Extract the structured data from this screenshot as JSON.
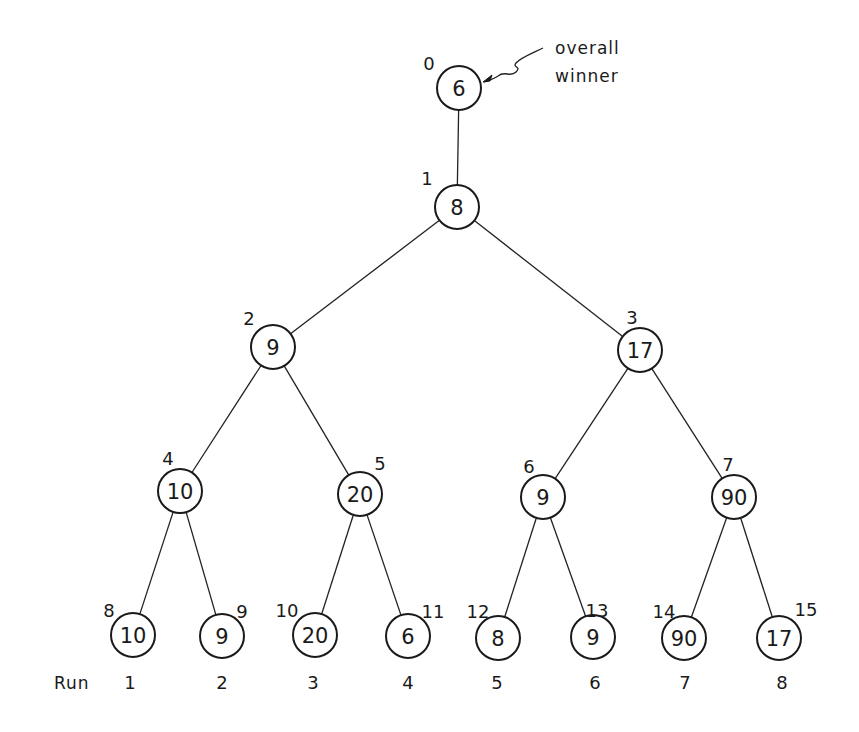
{
  "diagram": {
    "annotation": {
      "line1": "overall",
      "line2": "winner",
      "points_to_node": 0
    },
    "run_label": "Run",
    "nodes": [
      {
        "index": "0",
        "value": "6",
        "x": 459,
        "y": 88
      },
      {
        "index": "1",
        "value": "8",
        "x": 457,
        "y": 207
      },
      {
        "index": "2",
        "value": "9",
        "x": 273,
        "y": 347
      },
      {
        "index": "3",
        "value": "17",
        "x": 640,
        "y": 350
      },
      {
        "index": "4",
        "value": "10",
        "x": 180,
        "y": 491
      },
      {
        "index": "5",
        "value": "20",
        "x": 360,
        "y": 494
      },
      {
        "index": "6",
        "value": "9",
        "x": 543,
        "y": 497
      },
      {
        "index": "7",
        "value": "90",
        "x": 734,
        "y": 497
      },
      {
        "index": "8",
        "value": "10",
        "x": 133,
        "y": 635
      },
      {
        "index": "9",
        "value": "9",
        "x": 222,
        "y": 636
      },
      {
        "index": "10",
        "value": "20",
        "x": 315,
        "y": 635
      },
      {
        "index": "11",
        "value": "6",
        "x": 408,
        "y": 636
      },
      {
        "index": "12",
        "value": "8",
        "x": 498,
        "y": 638
      },
      {
        "index": "13",
        "value": "9",
        "x": 593,
        "y": 637
      },
      {
        "index": "14",
        "value": "90",
        "x": 684,
        "y": 638
      },
      {
        "index": "15",
        "value": "17",
        "x": 779,
        "y": 638
      }
    ],
    "index_label_offsets": [
      {
        "dx": -30,
        "dy": -18
      },
      {
        "dx": -30,
        "dy": -22
      },
      {
        "dx": -24,
        "dy": -22
      },
      {
        "dx": -8,
        "dy": -26
      },
      {
        "dx": -12,
        "dy": -26
      },
      {
        "dx": 20,
        "dy": -24
      },
      {
        "dx": -14,
        "dy": -24
      },
      {
        "dx": -6,
        "dy": -26
      },
      {
        "dx": -24,
        "dy": -18
      },
      {
        "dx": 20,
        "dy": -18
      },
      {
        "dx": -28,
        "dy": -18
      },
      {
        "dx": 25,
        "dy": -18
      },
      {
        "dx": -20,
        "dy": -20
      },
      {
        "dx": 4,
        "dy": -20
      },
      {
        "dx": -20,
        "dy": -20
      },
      {
        "dx": 27,
        "dy": -22
      }
    ],
    "edges": [
      [
        0,
        1
      ],
      [
        1,
        2
      ],
      [
        1,
        3
      ],
      [
        2,
        4
      ],
      [
        2,
        5
      ],
      [
        3,
        6
      ],
      [
        3,
        7
      ],
      [
        4,
        8
      ],
      [
        4,
        9
      ],
      [
        5,
        10
      ],
      [
        5,
        11
      ],
      [
        6,
        12
      ],
      [
        6,
        13
      ],
      [
        7,
        14
      ],
      [
        7,
        15
      ]
    ],
    "runs": [
      {
        "label": "1",
        "x": 130
      },
      {
        "label": "2",
        "x": 222
      },
      {
        "label": "3",
        "x": 313
      },
      {
        "label": "4",
        "x": 408
      },
      {
        "label": "5",
        "x": 497
      },
      {
        "label": "6",
        "x": 595
      },
      {
        "label": "7",
        "x": 685
      },
      {
        "label": "8",
        "x": 782
      }
    ]
  }
}
